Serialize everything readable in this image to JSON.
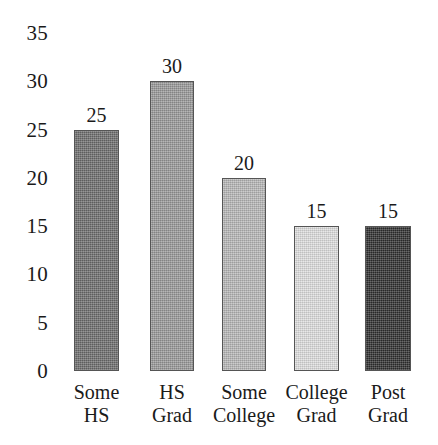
{
  "chart_data": {
    "type": "bar",
    "title": "",
    "subtitle": "",
    "xlabel": "",
    "ylabel": "",
    "categories": [
      "Some HS",
      "HS Grad",
      "Some College",
      "College Grad",
      "Post Grad"
    ],
    "category_lines": [
      [
        "Some",
        "HS"
      ],
      [
        "HS",
        "Grad"
      ],
      [
        "Some",
        "College"
      ],
      [
        "College",
        "Grad"
      ],
      [
        "Post",
        "Grad"
      ]
    ],
    "values": [
      25,
      30,
      20,
      15,
      15
    ],
    "value_labels": [
      "25",
      "30",
      "20",
      "15",
      "15"
    ],
    "ylim": [
      0,
      35
    ],
    "yticks": [
      0,
      5,
      10,
      15,
      20,
      25,
      30,
      35
    ],
    "ytick_labels": [
      "0",
      "5",
      "10",
      "15",
      "20",
      "25",
      "30",
      "35"
    ],
    "grid": false,
    "legend": null,
    "legend_position": "none",
    "bar_colors": [
      "#6e6e6e",
      "#9a9a9a",
      "#b8b8b8",
      "#e0e0e0",
      "#2e2e2e"
    ],
    "bar_edge_color": "#555555",
    "background_color": "#ffffff",
    "text_color": "#1a1a1a"
  }
}
